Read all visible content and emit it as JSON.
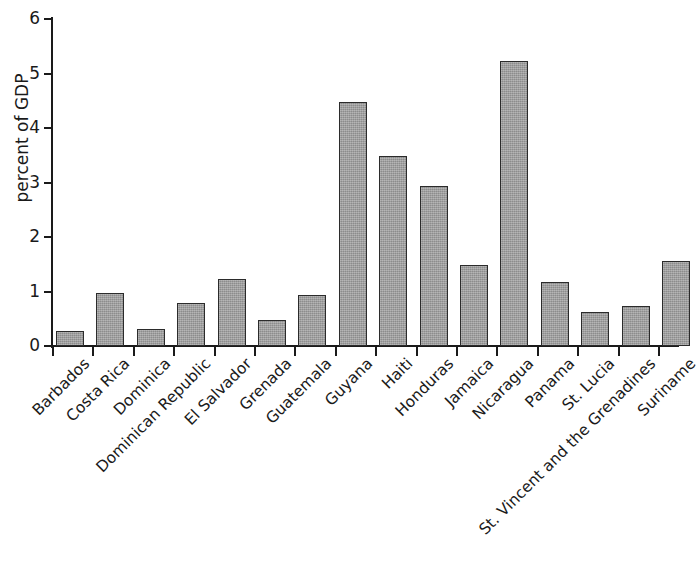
{
  "chart_data": {
    "type": "bar",
    "title": "",
    "subtitle": "",
    "xlabel": "",
    "ylabel": "percent of GDP",
    "ylim": [
      0,
      6
    ],
    "yticks": [
      0,
      1,
      2,
      3,
      4,
      5,
      6
    ],
    "ytick_labels": [
      "0",
      "1",
      "2",
      "3",
      "4",
      "5",
      "6"
    ],
    "grid": false,
    "legend": null,
    "bar_color": "#9d9d9d",
    "bar_edge_color": "#2b2b2b",
    "axis_color": "#1a1a1a",
    "background_color": "#ffffff",
    "xtick_label_rotation": -45,
    "categories": [
      "Barbados",
      "Costa Rica",
      "Dominica",
      "Dominican Republic",
      "El Salvador",
      "Grenada",
      "Guatemala",
      "Guyana",
      "Haiti",
      "Honduras",
      "Jamaica",
      "Nicaragua",
      "Panama",
      "St. Lucia",
      "St. Vincent and the Grenadines",
      "Suriname"
    ],
    "values": [
      0.28,
      0.97,
      0.31,
      0.78,
      1.23,
      0.47,
      0.93,
      4.47,
      3.48,
      2.93,
      1.49,
      5.23,
      1.18,
      0.63,
      0.73,
      1.56
    ]
  }
}
